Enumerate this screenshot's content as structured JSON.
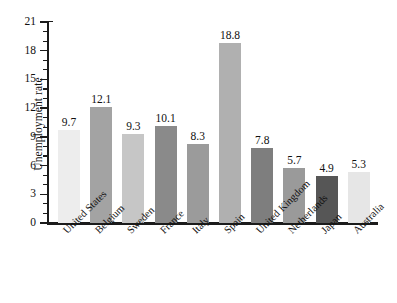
{
  "chart_data": {
    "type": "bar",
    "title": "",
    "xlabel": "",
    "ylabel": "Unemployment rate",
    "categories": [
      "United States",
      "Belgium",
      "Sweden",
      "France",
      "Italy",
      "Spain",
      "United Kingdom",
      "Netherlands",
      "Japan",
      "Australia"
    ],
    "values": [
      9.7,
      12.1,
      9.3,
      10.1,
      8.3,
      18.8,
      7.8,
      5.7,
      4.9,
      5.3
    ],
    "value_labels": [
      "9.7",
      "12.1",
      "9.3",
      "10.1",
      "8.3",
      "18.8",
      "7.8",
      "5.7",
      "4.9",
      "5.3"
    ],
    "bar_colors": [
      "#ededed",
      "#a3a3a3",
      "#c6c6c6",
      "#8a8a8a",
      "#9b9b9b",
      "#b0b0b0",
      "#7e7e7e",
      "#9a9a9a",
      "#565656",
      "#e6e6e6"
    ],
    "ylim": [
      0,
      21
    ],
    "ytick_major": [
      0,
      3,
      6,
      9,
      12,
      15,
      18,
      21
    ],
    "ytick_major_labels": [
      "0",
      "3",
      "6",
      "9",
      "12",
      "15",
      "18",
      "21"
    ],
    "ytick_minor_step": 1,
    "grid": false,
    "legend": null,
    "axis_color": "#1b1b1b",
    "background": "#ffffff"
  },
  "axis": {
    "y_title": "Unemployment rate"
  }
}
